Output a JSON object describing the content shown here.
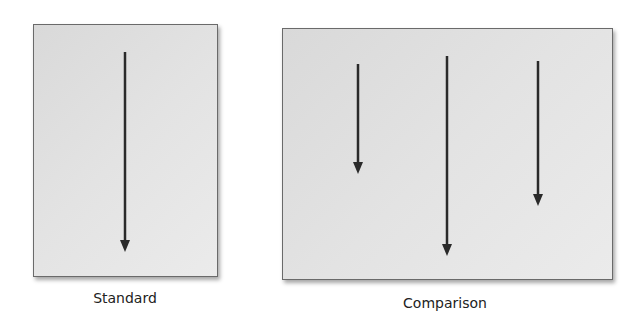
{
  "figure": {
    "panels": [
      {
        "id": "standard",
        "label": "Standard",
        "box": {
          "x": 33,
          "y": 24,
          "w": 183,
          "h": 251
        },
        "label_pos": {
          "cx": 125,
          "y": 290
        },
        "arrows": [
          {
            "x": 125,
            "y1": 52,
            "y2": 252
          }
        ]
      },
      {
        "id": "comparison",
        "label": "Comparison",
        "box": {
          "x": 282,
          "y": 28,
          "w": 329,
          "h": 250
        },
        "label_pos": {
          "cx": 445,
          "y": 295
        },
        "arrows": [
          {
            "x": 358,
            "y1": 64,
            "y2": 174
          },
          {
            "x": 447,
            "y1": 56,
            "y2": 256
          },
          {
            "x": 538,
            "y1": 61,
            "y2": 206
          }
        ]
      }
    ],
    "colors": {
      "arrow": "#2a2a2a",
      "panel_border": "#6a6a6a"
    }
  }
}
